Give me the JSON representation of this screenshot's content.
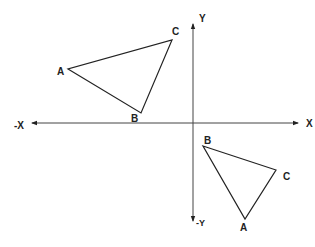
{
  "diagram": {
    "type": "coordinate-plane-triangles",
    "axes": {
      "x_positive_label": "X",
      "x_negative_label": "-X",
      "y_positive_label": "Y",
      "y_negative_label": "-Y",
      "origin": [
        193,
        123
      ],
      "x_range_px": [
        32,
        298
      ],
      "y_range_px": [
        24,
        220
      ]
    },
    "triangles": [
      {
        "name": "upper-left-triangle",
        "quadrant": "II",
        "vertices": [
          {
            "label": "A",
            "x": 68,
            "y": 69,
            "label_x": 61,
            "label_y": 75
          },
          {
            "label": "B",
            "x": 141,
            "y": 113,
            "label_x": 135,
            "label_y": 121
          },
          {
            "label": "C",
            "x": 172,
            "y": 40,
            "label_x": 176,
            "label_y": 35
          }
        ]
      },
      {
        "name": "lower-right-triangle",
        "quadrant": "IV",
        "vertices": [
          {
            "label": "B",
            "x": 203,
            "y": 146,
            "label_x": 207,
            "label_y": 145
          },
          {
            "label": "C",
            "x": 276,
            "y": 170,
            "label_x": 286,
            "label_y": 180
          },
          {
            "label": "A",
            "x": 245,
            "y": 219,
            "label_x": 244,
            "label_y": 231
          }
        ]
      }
    ],
    "colors": {
      "line": "#222222",
      "background": "#ffffff"
    }
  }
}
